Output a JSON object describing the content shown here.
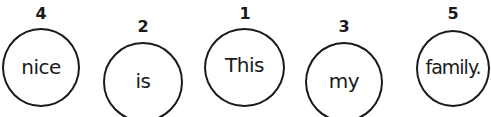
{
  "exercise": {
    "type": "word-order",
    "bubbles": [
      {
        "word": "nice",
        "number": "4"
      },
      {
        "word": "is",
        "number": "2"
      },
      {
        "word": "This",
        "number": "1"
      },
      {
        "word": "my",
        "number": "3"
      },
      {
        "word": "family.",
        "number": "5"
      }
    ],
    "stroke_color": "#1a1a1a",
    "background_color": "#ffffff"
  }
}
